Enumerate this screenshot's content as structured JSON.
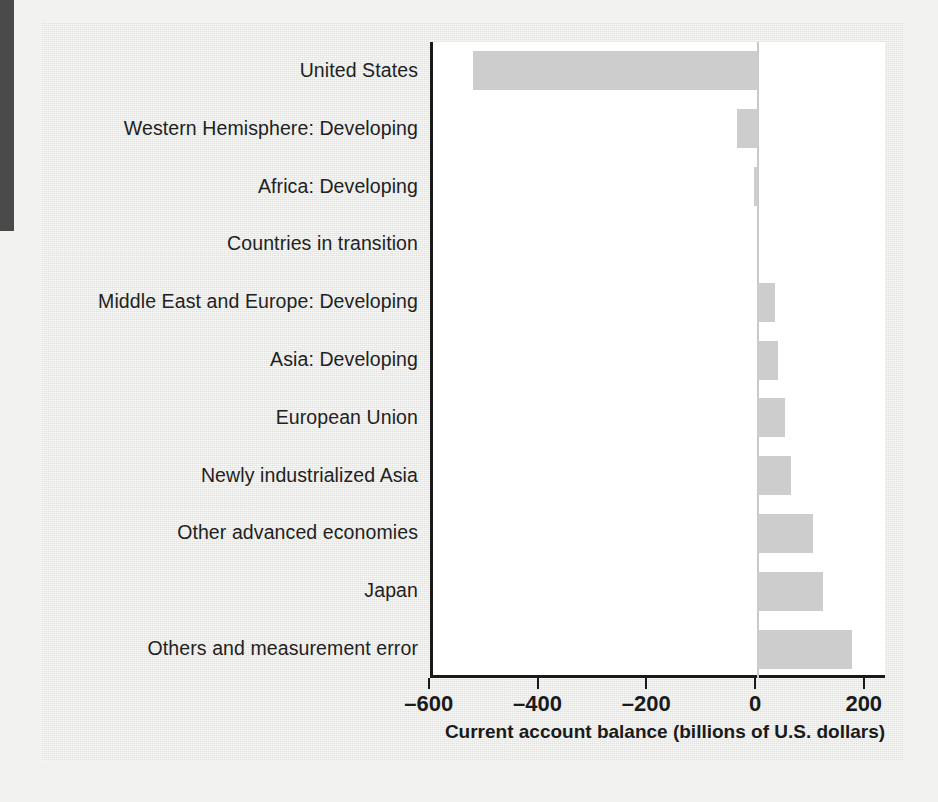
{
  "figure": {
    "axis_title": "Current account balance (billions of U.S. dollars)",
    "colors": {
      "bar_fill": "#cdcdcd",
      "axis": "#1a1a1a",
      "plot_background": "#ffffff",
      "panel_background": "#e9e9e7",
      "page_background": "#f2f2f0",
      "edge_strip": "#4a4a4a",
      "zero_line": "#c9c9c9"
    }
  },
  "chart_data": {
    "type": "bar",
    "orientation": "horizontal",
    "title": "",
    "subtitle": "",
    "xlabel": "Current account balance (billions of U.S. dollars)",
    "ylabel": "",
    "xlim": [
      -650,
      220
    ],
    "xticks": [
      -600,
      -400,
      -200,
      0,
      200
    ],
    "xticklabels": [
      "–600",
      "–400",
      "–200",
      "0",
      "200"
    ],
    "grid": false,
    "legend": false,
    "legend_position": "none",
    "categories": [
      "United States",
      "Western Hemisphere: Developing",
      "Africa: Developing",
      "Countries in transition",
      "Middle East and Europe: Developing",
      "Asia: Developing",
      "European Union",
      "Newly industrialized Asia",
      "Other advanced economies",
      "Japan",
      "Others and measurement error"
    ],
    "values": [
      -525,
      -39,
      -7,
      0,
      31,
      37,
      50,
      60,
      101,
      120,
      172
    ],
    "units": "billions of U.S. dollars"
  }
}
